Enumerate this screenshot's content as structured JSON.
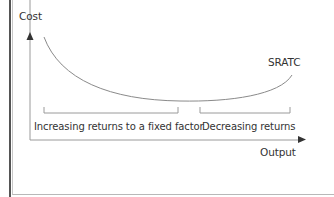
{
  "diagram": {
    "type": "cost-curve",
    "y_axis_label": "Cost",
    "x_axis_label": "Output",
    "curve_label": "SRATC",
    "regions": [
      {
        "label": "Increasing returns to a fixed factor"
      },
      {
        "label": "Decreasing returns"
      }
    ]
  },
  "colors": {
    "line": "#8a8a8a",
    "axis": "#8a8a8a",
    "arrow": "#333333",
    "text": "#333333",
    "frame_dark": "#555555",
    "frame_light": "#c8c8c8"
  }
}
